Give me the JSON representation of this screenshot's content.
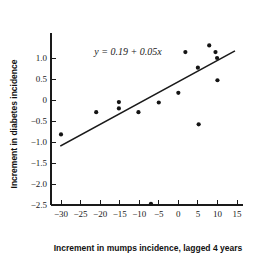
{
  "chart_data": {
    "type": "scatter",
    "title": "",
    "xlabel": "Increment in mumps incidence, lagged 4 years",
    "ylabel": "Increment in diabetes incidence",
    "xlim": [
      -32,
      16
    ],
    "ylim": [
      -2.62,
      1.35
    ],
    "xticks": [
      -30,
      -25,
      -20,
      -15,
      -10,
      -5,
      0,
      5,
      10,
      15
    ],
    "xtick_labels": [
      "−30",
      "−25",
      "−20",
      "−15",
      "−10",
      "−5",
      "0",
      "5",
      "10",
      "15"
    ],
    "yticks": [
      1.0,
      0.5,
      0.0,
      -0.5,
      -1.0,
      -1.5,
      -2.0,
      -2.5
    ],
    "ytick_labels": [
      "1.0",
      "0.5",
      "0",
      "−0.5",
      "−1.0",
      "−1.5",
      "−2.0",
      "−2.5"
    ],
    "grid": false,
    "legend": null,
    "annotations": [
      {
        "name": "regression-equation",
        "text": "y = 0.19 + 0.05x",
        "x": -21.5,
        "y": 1.08
      }
    ],
    "series": [
      {
        "name": "observations",
        "type": "scatter",
        "marker": "filled-circle",
        "color": "#141414",
        "points": [
          {
            "x": -30.0,
            "y": -0.82
          },
          {
            "x": -21.0,
            "y": -0.29
          },
          {
            "x": -15.2,
            "y": -0.05
          },
          {
            "x": -15.2,
            "y": -0.2
          },
          {
            "x": -10.2,
            "y": -0.29
          },
          {
            "x": -7.0,
            "y": -2.47
          },
          {
            "x": -5.0,
            "y": -0.06
          },
          {
            "x": 0.0,
            "y": 0.17
          },
          {
            "x": 1.8,
            "y": 1.14
          },
          {
            "x": 5.0,
            "y": 0.77
          },
          {
            "x": 5.2,
            "y": -0.58
          },
          {
            "x": 7.9,
            "y": 1.3
          },
          {
            "x": 9.5,
            "y": 1.14
          },
          {
            "x": 10.0,
            "y": 0.47
          },
          {
            "x": 9.9,
            "y": 1.0
          }
        ]
      },
      {
        "name": "fitted-regression-line",
        "type": "line",
        "color": "#141414",
        "equation": "y = 0.19 + 0.05x",
        "intercept": 0.19,
        "slope": 0.05,
        "x_start": -30.0,
        "y_start": -1.09,
        "x_end": 14.3,
        "y_end": 1.16
      }
    ]
  }
}
